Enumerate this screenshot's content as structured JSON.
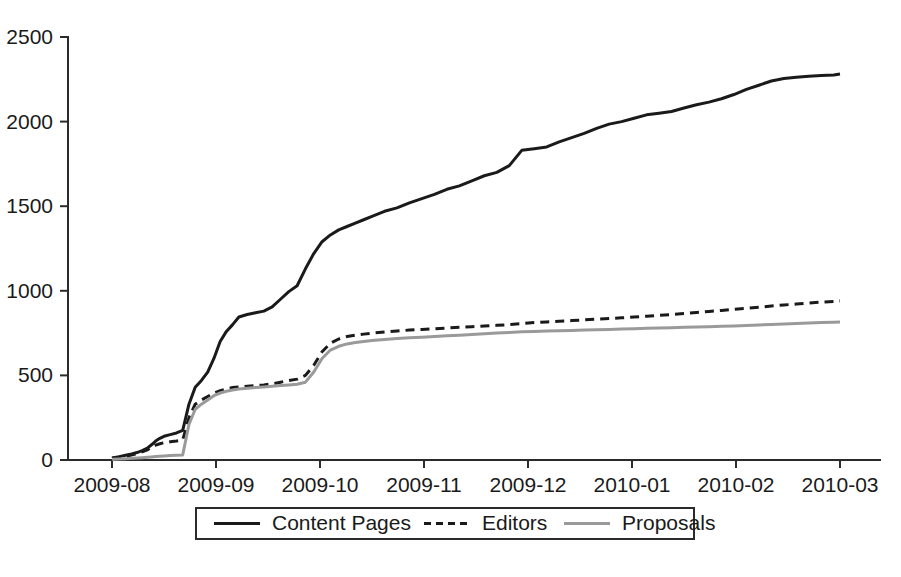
{
  "chart_data": {
    "type": "line",
    "title": "",
    "subtitle": "",
    "xlabel": "",
    "ylabel": "",
    "xlim": [
      "2009-08",
      "2010-03"
    ],
    "ylim": [
      0,
      2500
    ],
    "yticks": [
      0,
      500,
      1000,
      1500,
      2000,
      2500
    ],
    "ytick_labels": [
      "0",
      "500",
      "1000",
      "1500",
      "2000",
      "2500"
    ],
    "xticks": [
      "2009-08",
      "2009-09",
      "2009-10",
      "2009-11",
      "2009-12",
      "2010-01",
      "2010-02",
      "2010-03"
    ],
    "xtick_labels": [
      "2009-08",
      "2009-09",
      "2009-10",
      "2009-11",
      "2009-12",
      "2010-01",
      "2010-02",
      "2010-03"
    ],
    "grid": false,
    "legend_position": "bottom-outside",
    "legend_entries": [
      "Content Pages",
      "Editors",
      "Proposals"
    ],
    "series": [
      {
        "name": "Content Pages",
        "color": "#1a1a1a",
        "dash": "none",
        "width": 3.0,
        "x": [
          0.0,
          0.07,
          0.13,
          0.19,
          0.24,
          0.29,
          0.34,
          0.38,
          0.42,
          0.46,
          0.5,
          0.56,
          0.62,
          0.68,
          0.74,
          0.8,
          0.86,
          0.92,
          0.98,
          1.04,
          1.1,
          1.16,
          1.22,
          1.3,
          1.38,
          1.46,
          1.54,
          1.62,
          1.7,
          1.78,
          1.86,
          1.94,
          2.02,
          2.1,
          2.18,
          2.26,
          2.34,
          2.42,
          2.5,
          2.62,
          2.74,
          2.86,
          2.98,
          3.1,
          3.22,
          3.34,
          3.46,
          3.58,
          3.7,
          3.82,
          3.94,
          4.06,
          4.18,
          4.3,
          4.42,
          4.54,
          4.66,
          4.78,
          4.9,
          5.02,
          5.14,
          5.26,
          5.38,
          5.5,
          5.62,
          5.74,
          5.86,
          5.98,
          6.1,
          6.22,
          6.34,
          6.46,
          6.58,
          6.7,
          6.82,
          6.94,
          7.0
        ],
        "y": [
          12,
          20,
          28,
          36,
          44,
          55,
          70,
          90,
          112,
          128,
          140,
          150,
          160,
          175,
          330,
          430,
          470,
          520,
          600,
          700,
          760,
          800,
          845,
          860,
          870,
          880,
          905,
          950,
          995,
          1030,
          1130,
          1220,
          1290,
          1330,
          1360,
          1380,
          1400,
          1420,
          1440,
          1470,
          1490,
          1520,
          1545,
          1570,
          1600,
          1620,
          1650,
          1680,
          1700,
          1740,
          1830,
          1840,
          1850,
          1880,
          1905,
          1930,
          1960,
          1985,
          2000,
          2020,
          2040,
          2050,
          2060,
          2080,
          2100,
          2115,
          2135,
          2160,
          2190,
          2215,
          2240,
          2255,
          2262,
          2268,
          2272,
          2276,
          2281
        ]
      },
      {
        "name": "Editors",
        "color": "#1a1a1a",
        "dash": "dashed",
        "width": 3.0,
        "x": [
          0.0,
          0.07,
          0.13,
          0.19,
          0.24,
          0.29,
          0.34,
          0.38,
          0.42,
          0.46,
          0.5,
          0.56,
          0.62,
          0.68,
          0.74,
          0.8,
          0.86,
          0.92,
          0.98,
          1.04,
          1.1,
          1.16,
          1.22,
          1.3,
          1.38,
          1.46,
          1.54,
          1.62,
          1.7,
          1.78,
          1.86,
          1.94,
          2.02,
          2.1,
          2.18,
          2.26,
          2.34,
          2.42,
          2.5,
          2.62,
          2.74,
          2.86,
          2.98,
          3.1,
          3.22,
          3.34,
          3.46,
          3.58,
          3.7,
          3.82,
          3.94,
          4.06,
          4.18,
          4.3,
          4.42,
          4.54,
          4.66,
          4.78,
          4.9,
          5.02,
          5.14,
          5.26,
          5.38,
          5.5,
          5.62,
          5.74,
          5.86,
          5.98,
          6.1,
          6.22,
          6.34,
          6.46,
          6.58,
          6.7,
          6.82,
          6.94,
          7.0
        ],
        "y": [
          10,
          16,
          22,
          30,
          38,
          48,
          60,
          75,
          88,
          96,
          102,
          108,
          112,
          118,
          250,
          330,
          355,
          375,
          395,
          410,
          420,
          428,
          432,
          436,
          440,
          444,
          450,
          460,
          470,
          478,
          500,
          560,
          640,
          690,
          715,
          730,
          738,
          744,
          750,
          756,
          762,
          768,
          772,
          776,
          780,
          784,
          788,
          792,
          796,
          800,
          806,
          812,
          816,
          820,
          824,
          828,
          832,
          836,
          840,
          845,
          850,
          855,
          860,
          866,
          872,
          878,
          884,
          890,
          897,
          903,
          910,
          916,
          922,
          928,
          933,
          937,
          940
        ]
      },
      {
        "name": "Proposals",
        "color": "#9a9a9a",
        "dash": "none",
        "width": 3.0,
        "x": [
          0.0,
          0.07,
          0.13,
          0.19,
          0.24,
          0.29,
          0.34,
          0.38,
          0.42,
          0.46,
          0.5,
          0.56,
          0.62,
          0.68,
          0.74,
          0.8,
          0.86,
          0.92,
          0.98,
          1.04,
          1.1,
          1.16,
          1.22,
          1.3,
          1.38,
          1.46,
          1.54,
          1.62,
          1.7,
          1.78,
          1.86,
          1.94,
          2.02,
          2.1,
          2.18,
          2.26,
          2.34,
          2.42,
          2.5,
          2.62,
          2.74,
          2.86,
          2.98,
          3.1,
          3.22,
          3.34,
          3.46,
          3.58,
          3.7,
          3.82,
          3.94,
          4.06,
          4.18,
          4.3,
          4.42,
          4.54,
          4.66,
          4.78,
          4.9,
          5.02,
          5.14,
          5.26,
          5.38,
          5.5,
          5.62,
          5.74,
          5.86,
          5.98,
          6.1,
          6.22,
          6.34,
          6.46,
          6.58,
          6.7,
          6.82,
          6.94,
          7.0
        ],
        "y": [
          4,
          6,
          8,
          10,
          12,
          14,
          16,
          18,
          20,
          22,
          24,
          26,
          28,
          30,
          210,
          300,
          330,
          355,
          380,
          396,
          406,
          414,
          420,
          424,
          428,
          432,
          436,
          440,
          444,
          448,
          460,
          520,
          600,
          650,
          672,
          686,
          694,
          700,
          706,
          712,
          718,
          722,
          726,
          730,
          734,
          738,
          742,
          746,
          750,
          754,
          758,
          760,
          762,
          764,
          766,
          768,
          770,
          772,
          774,
          776,
          778,
          780,
          782,
          784,
          786,
          788,
          790,
          792,
          795,
          798,
          801,
          804,
          807,
          810,
          812,
          814,
          815
        ]
      }
    ]
  },
  "legend": {
    "items": [
      {
        "label": "Content Pages",
        "color": "#1a1a1a",
        "dash": "none"
      },
      {
        "label": "Editors",
        "color": "#1a1a1a",
        "dash": "dashed"
      },
      {
        "label": "Proposals",
        "color": "#9a9a9a",
        "dash": "none"
      }
    ]
  },
  "colors": {
    "axis": "#2b2b2b",
    "text": "#1a1a1a",
    "background": "#ffffff",
    "content_pages": "#1a1a1a",
    "editors": "#1a1a1a",
    "proposals": "#9a9a9a"
  }
}
